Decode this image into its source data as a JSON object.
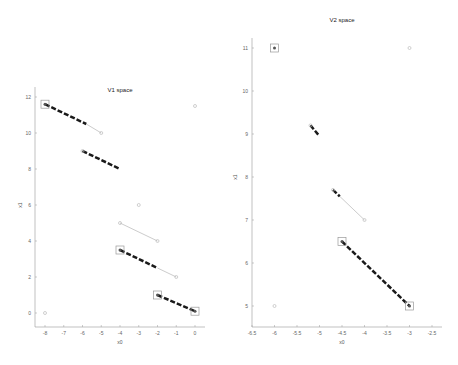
{
  "chart_data": [
    {
      "type": "scatter",
      "title": "V1 space",
      "xlabel": "x0",
      "ylabel": "x1",
      "xlim": [
        -8,
        0
      ],
      "ylim": [
        0,
        12
      ],
      "xticks": [
        -8,
        -7,
        -6,
        -5,
        -4,
        -3,
        -2,
        -1,
        0
      ],
      "yticks": [
        0,
        2,
        4,
        6,
        8,
        10,
        12
      ],
      "grid": false,
      "box_points": [
        [
          -8,
          11.6
        ],
        [
          -4,
          3.5
        ],
        [
          -2,
          1
        ],
        [
          0,
          0.1
        ]
      ],
      "circle_points": [
        [
          0,
          11.5
        ],
        [
          -5,
          10
        ],
        [
          -6,
          9
        ],
        [
          -3,
          6
        ],
        [
          -4,
          5
        ],
        [
          -2,
          4
        ],
        [
          -1,
          2
        ],
        [
          -8,
          0
        ]
      ],
      "dashed_segments": [
        [
          [
            -8,
            11.6
          ],
          [
            -5.8,
            10.5
          ]
        ],
        [
          [
            -6,
            9
          ],
          [
            -4,
            8
          ]
        ],
        [
          [
            -4,
            3.5
          ],
          [
            -2,
            2.5
          ]
        ],
        [
          [
            -2,
            1
          ],
          [
            0,
            0.1
          ]
        ]
      ],
      "gray_segments": [
        [
          [
            -5.8,
            10.5
          ],
          [
            -5,
            10
          ]
        ],
        [
          [
            -4,
            5
          ],
          [
            -2,
            4
          ]
        ],
        [
          [
            -2,
            2.5
          ],
          [
            -1,
            2
          ]
        ]
      ]
    },
    {
      "type": "scatter",
      "title": "V2 space",
      "xlabel": "x0",
      "ylabel": "x1",
      "xlim": [
        -6.5,
        -2.5
      ],
      "ylim": [
        5,
        11
      ],
      "xticks": [
        -6.5,
        -6,
        -5.5,
        -5,
        -4.5,
        -4,
        -3.5,
        -3,
        -2.5
      ],
      "yticks": [
        5,
        6,
        7,
        8,
        9,
        10,
        11
      ],
      "grid": false,
      "box_points": [
        [
          -6,
          11
        ],
        [
          -4.5,
          6.5
        ],
        [
          -3,
          5
        ]
      ],
      "circle_points": [
        [
          -3,
          11
        ],
        [
          -5.2,
          9.2
        ],
        [
          -4.7,
          7.7
        ],
        [
          -4,
          7
        ],
        [
          -6,
          5
        ]
      ],
      "dashed_segments": [
        [
          [
            -5.2,
            9.2
          ],
          [
            -5.0,
            8.95
          ]
        ],
        [
          [
            -4.7,
            7.7
          ],
          [
            -4.55,
            7.55
          ]
        ],
        [
          [
            -4.5,
            6.5
          ],
          [
            -3,
            5
          ]
        ]
      ],
      "gray_segments": [
        [
          [
            -4.55,
            7.55
          ],
          [
            -4,
            7
          ]
        ]
      ]
    }
  ],
  "colors": {
    "dashed": "#1a1a1a",
    "gray_line": "#cccccc",
    "marker": "#bbbbbb",
    "axis": "#999999"
  }
}
